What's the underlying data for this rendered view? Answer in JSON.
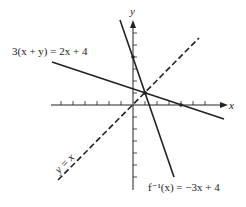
{
  "diagram": {
    "axes": {
      "x_label": "x",
      "y_label": "y",
      "origin_px": [
        133,
        105
      ],
      "unit_px": 12,
      "x_ticks": [
        -6,
        -5,
        -4,
        -3,
        -2,
        -1,
        1,
        2,
        3,
        4,
        5,
        6
      ],
      "y_ticks": [
        -6,
        -5,
        -4,
        -3,
        -2,
        -1,
        1,
        2,
        3,
        4,
        5,
        6
      ]
    },
    "lines": [
      {
        "name": "3(x + y) = 2x + 4",
        "equation": "y = (-x + 4)/3",
        "style": "solid"
      },
      {
        "name": "f⁻¹(x) = −3x + 4",
        "equation": "y = -3x + 4",
        "style": "solid"
      },
      {
        "name": "y = x",
        "equation": "y = x",
        "style": "dashed"
      }
    ],
    "labels": {
      "line1": "3(x + y) = 2x + 4",
      "line2": "f⁻¹(x) = −3x + 4",
      "line3": "y = x"
    },
    "points": [
      {
        "label": "(0, 4)"
      },
      {
        "label": "(1, 1)"
      },
      {
        "label": "(4, 0)"
      }
    ],
    "color": "#222222"
  }
}
